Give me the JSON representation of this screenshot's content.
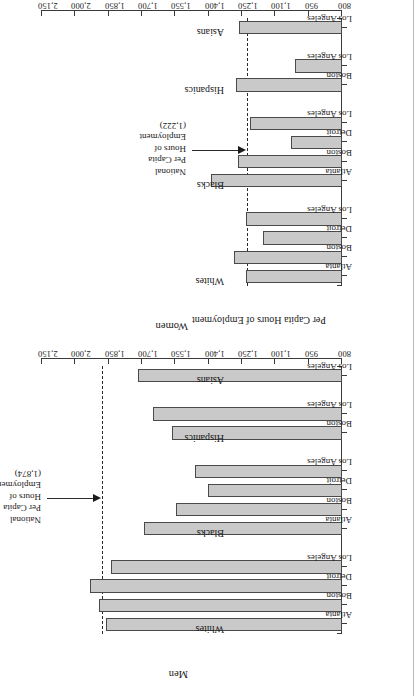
{
  "figure": {
    "axis_title": "Per Capita Hours of Employment",
    "panels": [
      "Women",
      "Men"
    ]
  },
  "chart_data": [
    {
      "type": "bar",
      "title": "Women",
      "xlabel": "",
      "ylabel": "Per Capita Hours of Employment",
      "ylim": [
        800,
        2150
      ],
      "yticks": [
        800,
        950,
        1100,
        1250,
        1400,
        1550,
        1700,
        1850,
        2000,
        2150
      ],
      "ytick_labels": [
        "800",
        "950",
        "1,100",
        "1,250",
        "1,400",
        "1,550",
        "1,700",
        "1,850",
        "2,000",
        "2,150"
      ],
      "grid": false,
      "orientation": "vertical-bars-rotated",
      "reference_line": {
        "label": "National Per Capita Hours of Employment",
        "value_label": "(1,222)",
        "value": 1222,
        "style": "dashed",
        "lines": [
          "National",
          "Per Capita",
          "Hours of",
          "Employment",
          "(1,222)"
        ]
      },
      "groups": [
        {
          "name": "Whites",
          "categories": [
            "Atlanta",
            "Boston",
            "Detroit",
            "Los Angeles"
          ],
          "values": [
            1230,
            1285,
            1155,
            1230
          ]
        },
        {
          "name": "Blacks",
          "categories": [
            "Atlanta",
            "Boston",
            "Detroit",
            "Los Angeles"
          ],
          "values": [
            1390,
            1270,
            1030,
            1215
          ]
        },
        {
          "name": "Hispanics",
          "categories": [
            "Boston",
            "Los Angeles"
          ],
          "values": [
            1275,
            1010
          ]
        },
        {
          "name": "Asians",
          "categories": [
            "Los Angeles"
          ],
          "values": [
            1265
          ]
        }
      ]
    },
    {
      "type": "bar",
      "title": "Men",
      "xlabel": "",
      "ylabel": "Per Capita Hours of Employment",
      "ylim": [
        800,
        2150
      ],
      "yticks": [
        800,
        950,
        1100,
        1250,
        1400,
        1550,
        1700,
        1850,
        2000,
        2150
      ],
      "ytick_labels": [
        "800",
        "950",
        "1,100",
        "1,250",
        "1,400",
        "1,550",
        "1,700",
        "1,850",
        "2,000",
        "2,150"
      ],
      "grid": false,
      "orientation": "vertical-bars-rotated",
      "reference_line": {
        "label": "National Per Capita Hours of Employment",
        "value_label": "(1,874)",
        "value": 1874,
        "style": "dashed",
        "lines": [
          "National",
          "Per Capita",
          "Hours of",
          "Employment",
          "(1,874)"
        ]
      },
      "groups": [
        {
          "name": "Whites",
          "categories": [
            "Atlanta",
            "Boston",
            "Detroit",
            "Los Angeles"
          ],
          "values": [
            1860,
            1895,
            1935,
            1840
          ]
        },
        {
          "name": "Blacks",
          "categories": [
            "Atlanta",
            "Boston",
            "Detroit",
            "Los Angeles"
          ],
          "values": [
            1690,
            1545,
            1405,
            1460
          ]
        },
        {
          "name": "Hispanics",
          "categories": [
            "Boston",
            "Los Angeles"
          ],
          "values": [
            1565,
            1650
          ]
        },
        {
          "name": "Asians",
          "categories": [
            "Los Angeles"
          ],
          "values": [
            1720
          ]
        }
      ]
    }
  ]
}
